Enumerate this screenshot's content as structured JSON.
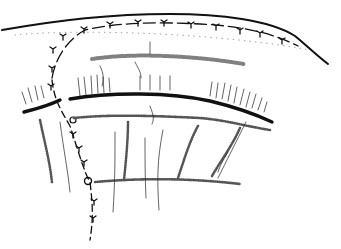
{
  "figure": {
    "type": "line-drawing",
    "colors": {
      "background": "#ffffff",
      "ink": "#111111",
      "stipple": "#555555"
    }
  },
  "elements": [
    {
      "name": "outer-skin-contour",
      "desc": "upper curved outline"
    },
    {
      "name": "interrupted-suture-line-top",
      "desc": "dashed arc with Y-shaped stitches"
    },
    {
      "name": "vertical-suture-line",
      "desc": "descending interrupted suture with knots"
    },
    {
      "name": "main-incision-line",
      "desc": "thick curved black line"
    },
    {
      "name": "stippled-band",
      "desc": "dotted horizontal band above incision"
    },
    {
      "name": "hatched-fibers",
      "desc": "fine radiating strokes around incision"
    },
    {
      "name": "dotted-mesh-lines",
      "desc": "dotted grid lines below incision"
    }
  ]
}
